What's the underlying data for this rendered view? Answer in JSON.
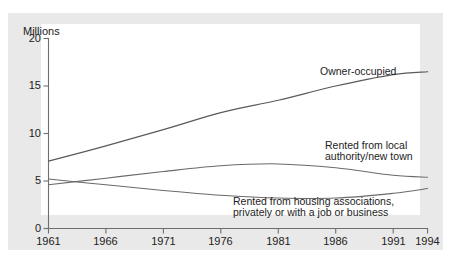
{
  "figure": {
    "background_color": "#ffffff",
    "panel_color": "#e9e9e9",
    "plot_color": "#ffffff",
    "axis_color": "#6e6e6e",
    "line_color": "#5a5a5a"
  },
  "axes": {
    "y_unit_label": "Millions",
    "y_ticks": [
      "0",
      "5",
      "10",
      "15",
      "20"
    ],
    "x_ticks": [
      "1961",
      "1966",
      "1971",
      "1976",
      "1981",
      "1986",
      "1991",
      "1994"
    ]
  },
  "annotations": {
    "owner_occupied": "Owner-occupied",
    "local_authority_line1": "Rented from local",
    "local_authority_line2": "authority/new town",
    "housing_assoc_line1": "Rented from housing associations,",
    "housing_assoc_line2": "privately or with a job or business"
  },
  "chart_data": {
    "type": "line",
    "title": "",
    "subtitle": "",
    "xlabel": "",
    "ylabel": "Millions",
    "xlim": [
      1961,
      1994
    ],
    "ylim": [
      0,
      20
    ],
    "grid": false,
    "legend_position": "inline-annotations",
    "y_tick_values": [
      0,
      5,
      10,
      15,
      20
    ],
    "x_tick_values": [
      1961,
      1966,
      1971,
      1976,
      1981,
      1986,
      1991,
      1994
    ],
    "x": [
      1961,
      1966,
      1971,
      1976,
      1981,
      1986,
      1991,
      1994
    ],
    "series": [
      {
        "name": "Owner-occupied",
        "values": [
          7.1,
          8.7,
          10.4,
          12.2,
          13.5,
          15.0,
          16.2,
          16.5
        ]
      },
      {
        "name": "Rented from local authority/new town",
        "values": [
          4.6,
          5.3,
          6.0,
          6.6,
          6.8,
          6.4,
          5.6,
          5.4
        ]
      },
      {
        "name": "Rented from housing associations, privately or with a job or business",
        "values": [
          5.2,
          4.6,
          4.0,
          3.5,
          3.2,
          3.2,
          3.7,
          4.2
        ]
      }
    ]
  }
}
